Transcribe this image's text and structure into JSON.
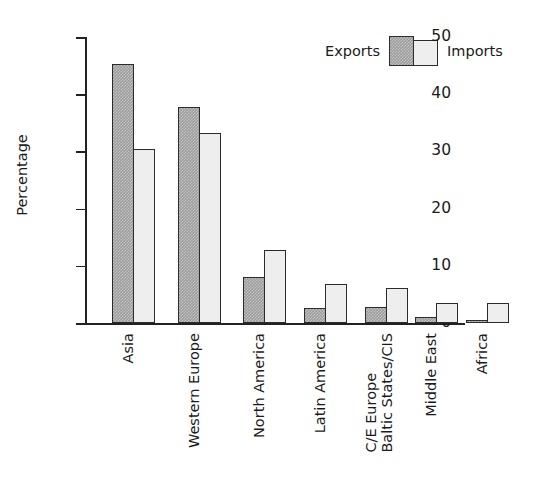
{
  "chart_data": {
    "type": "bar",
    "title": "",
    "subtitle": "",
    "xlabel": "",
    "ylabel": "Percentage",
    "ylim": [
      0,
      50
    ],
    "yticks": [
      0,
      10,
      20,
      30,
      40,
      50
    ],
    "grid": false,
    "legend_position": "top-right",
    "categories": [
      "Asia",
      "Western Europe",
      "North America",
      "Latin America",
      "C/E Europe\nBaltic States/CIS",
      "Middle East",
      "Africa"
    ],
    "series": [
      {
        "name": "Exports",
        "values": [
          45.3,
          37.7,
          8.0,
          2.7,
          2.8,
          1.1,
          0.6
        ],
        "color": "#9c9c9c"
      },
      {
        "name": "Imports",
        "values": [
          30.5,
          33.3,
          12.7,
          6.9,
          6.1,
          3.5,
          3.5
        ],
        "color": "#eeeeee"
      }
    ]
  },
  "legend": {
    "exports_label": "Exports",
    "imports_label": "Imports"
  },
  "axis": {
    "y_title": "Percentage",
    "y_ticks": [
      {
        "value": 50,
        "label": "50"
      },
      {
        "value": 40,
        "label": "40"
      },
      {
        "value": 30,
        "label": "30"
      },
      {
        "value": 20,
        "label": "20"
      },
      {
        "value": 10,
        "label": "10"
      },
      {
        "value": 0,
        "label": "0"
      }
    ]
  },
  "categories": [
    {
      "line1": "Asia",
      "line2": ""
    },
    {
      "line1": "Western Europe",
      "line2": ""
    },
    {
      "line1": "North America",
      "line2": ""
    },
    {
      "line1": "Latin America",
      "line2": ""
    },
    {
      "line1": "C/E Europe",
      "line2": "Baltic States/CIS"
    },
    {
      "line1": "Middle East",
      "line2": ""
    },
    {
      "line1": "Africa",
      "line2": ""
    }
  ]
}
